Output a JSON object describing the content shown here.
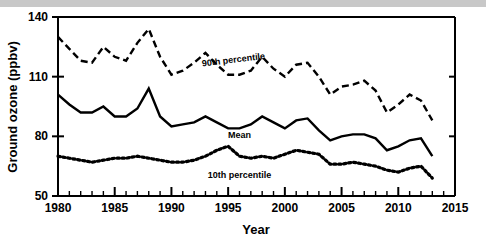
{
  "figure": {
    "background_color": "#ffffff",
    "top_strip_color": "#c8c8c8"
  },
  "chart_data": {
    "type": "line",
    "title": "",
    "xlabel": "Year",
    "ylabel": "Ground ozone (ppbv)",
    "xlim": [
      1980,
      2015
    ],
    "ylim": [
      50,
      140
    ],
    "grid": false,
    "legend_position": "inline-annotations",
    "x_major_ticks": [
      1980,
      1985,
      1990,
      1995,
      2000,
      2005,
      2010,
      2015
    ],
    "x_minor_tick_interval": 1,
    "y_major_ticks": [
      50,
      80,
      110,
      140
    ],
    "y_tick_labels": [
      "50",
      "80",
      "110",
      "140"
    ],
    "x_tick_labels": [
      "1980",
      "1985",
      "1990",
      "1995",
      "2000",
      "2005",
      "2010",
      "2015"
    ],
    "x": [
      1980,
      1981,
      1982,
      1983,
      1984,
      1985,
      1986,
      1987,
      1988,
      1989,
      1990,
      1991,
      1992,
      1993,
      1994,
      1995,
      1996,
      1997,
      1998,
      1999,
      2000,
      2001,
      2002,
      2003,
      2004,
      2005,
      2006,
      2007,
      2008,
      2009,
      2010,
      2011,
      2012,
      2013
    ],
    "series": [
      {
        "name": "90th percentile",
        "label": "90th percentile",
        "style": "dashed",
        "color": "#000000",
        "values": [
          130,
          124,
          118,
          117,
          125,
          120,
          118,
          127,
          134,
          120,
          111,
          113,
          117,
          122,
          116,
          111,
          111,
          113,
          120,
          114,
          110,
          116,
          117,
          110,
          101,
          105,
          106,
          108,
          103,
          92,
          96,
          101,
          98,
          88
        ]
      },
      {
        "name": "Mean",
        "label": "Mean",
        "style": "solid",
        "color": "#000000",
        "values": [
          101,
          96,
          92,
          92,
          95,
          90,
          90,
          94,
          104,
          90,
          85,
          86,
          87,
          90,
          87,
          84,
          84,
          86,
          90,
          87,
          84,
          88,
          89,
          83,
          78,
          80,
          81,
          81,
          79,
          73,
          75,
          78,
          79,
          70
        ]
      },
      {
        "name": "10th percentile",
        "label": "10th percentile",
        "style": "dotted",
        "color": "#000000",
        "values": [
          70,
          69,
          68,
          67,
          68,
          69,
          69,
          70,
          69,
          68,
          67,
          67,
          68,
          70,
          73,
          75,
          70,
          69,
          70,
          69,
          71,
          73,
          72,
          71,
          66,
          66,
          67,
          66,
          65,
          63,
          62,
          64,
          65,
          59
        ]
      }
    ],
    "annotations": [
      {
        "text": "90th percentile",
        "x": 1995.5,
        "y": 117,
        "rotation": -7
      },
      {
        "text": "Mean",
        "x": 1996.0,
        "y": 79,
        "rotation": 0
      },
      {
        "text": "10th percentile",
        "x": 1996.0,
        "y": 59,
        "rotation": 0
      }
    ]
  }
}
